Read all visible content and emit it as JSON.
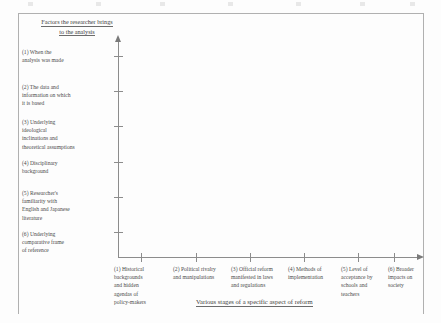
{
  "figure": {
    "y_axis_title": "Factors the researcher brings to the analysis",
    "x_axis_title": "Various stages of a specific aspect of reform",
    "y_axis_title_line1": "Factors the researcher brings",
    "y_axis_title_line2": "to the analysis"
  },
  "chart_data": {
    "type": "scatter",
    "title": "",
    "xlabel": "Various stages of a specific aspect of reform",
    "ylabel": "Factors the researcher brings to the analysis",
    "grid": false,
    "legend": "none",
    "series": [],
    "values": [],
    "note": "Empty analytical matrix / framework grid with labelled categorical axes and no plotted data points",
    "y_categories": [
      "(1) When the analysis was made",
      "(2) The data and information on which it is based",
      "(3) Underlying ideological inclinations and theoretical assumptions",
      "(4) Disciplinary background",
      "(5) Researcher's familiarity with English and Japanese literature",
      "(6) Underlying comparative frame of reference"
    ],
    "x_categories": [
      "(1) Historical backgrounds and hidden agendas of policy-makers",
      "(2) Political rivalry and manipulations",
      "(3) Official reform manifested in laws and regulations",
      "(4) Methods of implementation",
      "(5) Level of acceptance by schools and teachers",
      "(6) Broader impacts on society"
    ]
  },
  "y_axis_labels": [
    {
      "id": 1,
      "lines": [
        "(1) When the",
        "analysis was made"
      ]
    },
    {
      "id": 2,
      "lines": [
        "(2) The data and",
        "information on which",
        "it is based"
      ]
    },
    {
      "id": 3,
      "lines": [
        "(3) Underlying",
        "ideological",
        "inclinations and",
        "theoretical assumptions"
      ]
    },
    {
      "id": 4,
      "lines": [
        "(4) Disciplinary",
        "background"
      ]
    },
    {
      "id": 5,
      "lines": [
        "(5) Researcher's",
        "familiarity with",
        "English and Japanese",
        "literature"
      ]
    },
    {
      "id": 6,
      "lines": [
        "(6) Underlying",
        "comparative frame",
        "of reference"
      ]
    }
  ],
  "x_axis_labels": [
    {
      "id": 1,
      "lines": [
        "(1) Historical",
        "backgrounds",
        "and hidden",
        "agendas of",
        "policy-makers"
      ]
    },
    {
      "id": 2,
      "lines": [
        "(2) Political rivalry",
        "and manipulations"
      ]
    },
    {
      "id": 3,
      "lines": [
        "(3) Official reform",
        "manifested in laws",
        "and regulations"
      ]
    },
    {
      "id": 4,
      "lines": [
        "(4) Methods of",
        "implementation"
      ]
    },
    {
      "id": 5,
      "lines": [
        "(5) Level of",
        "acceptance by",
        "schools and",
        "teachers"
      ]
    },
    {
      "id": 6,
      "lines": [
        "(6) Broader",
        "impacts on",
        "society"
      ]
    }
  ],
  "colors": {
    "axis": "#8c8c8c",
    "text": "#4b4b4b",
    "border": "#b0b0b0",
    "page": "#fdfdfd"
  }
}
